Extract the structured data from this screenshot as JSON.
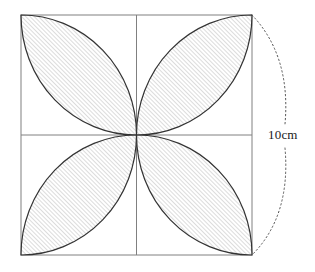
{
  "figure": {
    "type": "geometry-diagram",
    "background_color": "#ffffff",
    "square": {
      "name": "outer-square",
      "x": 21,
      "y": 15,
      "width": 231,
      "height": 240,
      "stroke_color": "#808080",
      "stroke_width": 1,
      "fill_color": "#ffffff"
    },
    "midlines": {
      "vertical_x": 136.5,
      "horizontal_y": 135,
      "stroke_color": "#808080",
      "stroke_width": 1
    },
    "petals": {
      "count": 4,
      "stroke_color": "#333333",
      "stroke_width": 1.2,
      "hatch": {
        "color": "#9a9a9a",
        "angle_degrees": 45,
        "spacing": 3,
        "line_width": 0.7
      },
      "items": [
        {
          "name": "petal-top-left",
          "quadrant": "top-left",
          "tip_corner": "top-left"
        },
        {
          "name": "petal-top-right",
          "quadrant": "top-right",
          "tip_corner": "top-right"
        },
        {
          "name": "petal-bottom-left",
          "quadrant": "bottom-left",
          "tip_corner": "bottom-left"
        },
        {
          "name": "petal-bottom-right",
          "quadrant": "bottom-right",
          "tip_corner": "bottom-right"
        }
      ]
    },
    "dimension": {
      "label": "10cm",
      "label_x": 267,
      "label_y": 128,
      "measures": "right side of square",
      "marker_style": "dotted-arc",
      "marker_color": "#555555",
      "arc_peak_x": 285,
      "arc_start": {
        "x": 252,
        "y": 15
      },
      "arc_end": {
        "x": 252,
        "y": 255
      },
      "gap_top_y": 124,
      "gap_bottom_y": 148
    }
  }
}
